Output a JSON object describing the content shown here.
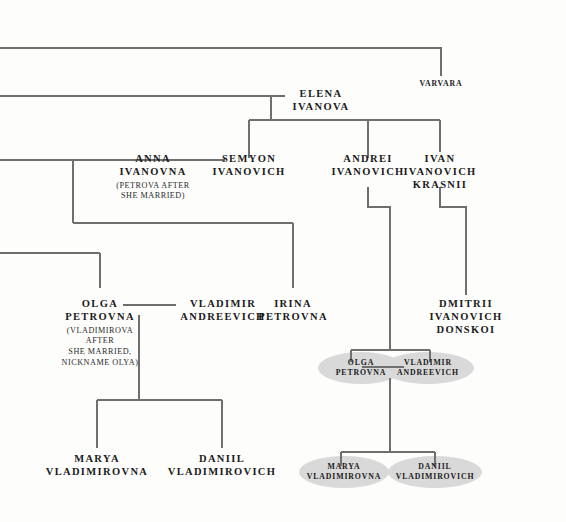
{
  "diagram": {
    "line_color": "#6f6f6f",
    "highlight_color": "#d9d9d9",
    "text_color": "#1b1b1b",
    "background_color": "#fdfdfc"
  },
  "nodes": {
    "varvara": {
      "name": "VARVARA",
      "sub": ""
    },
    "elena": {
      "name": "ELENA\nIVANOVA",
      "line1": "ELENA",
      "line2": "IVANOVA",
      "sub": ""
    },
    "anna": {
      "line1": "ANNA",
      "line2": "IVANOVNA",
      "sub": "(PETROVA AFTER\nSHE MARRIED)"
    },
    "semyon": {
      "line1": "SEMYON",
      "line2": "IVANOVICH",
      "sub": ""
    },
    "andrei": {
      "line1": "ANDREI",
      "line2": "IVANOVICH",
      "sub": ""
    },
    "ivan": {
      "line1": "IVAN",
      "line2": "IVANOVICH",
      "line3": "KRASNII",
      "sub": ""
    },
    "olga": {
      "line1": "OLGA",
      "line2": "PETROVNA",
      "sub": "(VLADIMIROVA\nAFTER\nSHE MARRIED,\nNICKNAME OLYA)"
    },
    "vladimir": {
      "line1": "VLADIMIR",
      "line2": "ANDREEVICH",
      "sub": ""
    },
    "irina": {
      "line1": "IRINA",
      "line2": "PETROVNA",
      "sub": ""
    },
    "dmitrii": {
      "line1": "DMITRII",
      "line2": "IVANOVICH",
      "line3": "DONSKOI",
      "sub": ""
    },
    "marya": {
      "line1": "MARYA",
      "line2": "VLADIMIROVNA",
      "sub": ""
    },
    "daniil": {
      "line1": "DANIIL",
      "line2": "VLADIMIROVICH",
      "sub": ""
    },
    "olga_hl": {
      "line1": "OLGA",
      "line2": "PETROVNA",
      "sub": ""
    },
    "vladimir_hl": {
      "line1": "VLADIMIR",
      "line2": "ANDREEVICH",
      "sub": ""
    },
    "marya_hl": {
      "line1": "MARYA",
      "line2": "VLADIMIROVNA",
      "sub": ""
    },
    "daniil_hl": {
      "line1": "DANIIL",
      "line2": "VLADIMIROVICH",
      "sub": ""
    }
  }
}
